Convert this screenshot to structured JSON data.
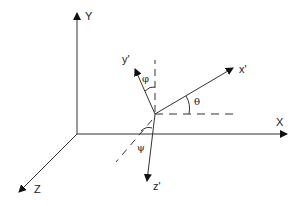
{
  "diagram": {
    "type": "coordinate-frame-rotation",
    "line_color": "#333333",
    "background": "#ffffff",
    "global_axes": [
      {
        "name": "X",
        "label": "X"
      },
      {
        "name": "Y",
        "label": "Y"
      },
      {
        "name": "Z",
        "label": "Z"
      }
    ],
    "local_axes": [
      {
        "name": "x-prime",
        "label": "x'"
      },
      {
        "name": "y-prime",
        "label": "y'"
      },
      {
        "name": "z-prime",
        "label": "z'"
      }
    ],
    "angles": [
      {
        "name": "phi",
        "label": "φ",
        "between": "y' and vertical reference"
      },
      {
        "name": "theta",
        "label": "θ",
        "between": "x' and horizontal reference"
      },
      {
        "name": "psi",
        "label": "ψ",
        "between": "z' and depth reference"
      }
    ]
  }
}
